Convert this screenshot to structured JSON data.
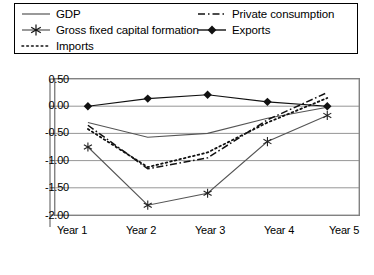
{
  "chart_data": {
    "type": "line",
    "title": "",
    "xlabel": "",
    "ylabel": "",
    "categories": [
      "Year 1",
      "Year 2",
      "Year 3",
      "Year 4",
      "Year 5"
    ],
    "ylim": [
      -2.0,
      0.5
    ],
    "yticks": [
      "0.50",
      "0.00",
      "-0.50",
      "-1.00",
      "-1.50",
      "-2.00"
    ],
    "ytick_values": [
      0.5,
      0.0,
      -0.5,
      -1.0,
      -1.5,
      -2.0
    ],
    "grid": true,
    "legend_position": "top",
    "series": [
      {
        "name": "GDP",
        "style": "solid",
        "marker": "none",
        "color": "#555555",
        "values": [
          -0.3,
          -0.57,
          -0.5,
          -0.22,
          -0.02
        ]
      },
      {
        "name": "Private consumption",
        "style": "dash-dot",
        "marker": "none",
        "color": "#111111",
        "values": [
          -0.35,
          -1.15,
          -0.95,
          -0.25,
          0.25
        ]
      },
      {
        "name": "Gross fixed capital formation",
        "style": "solid",
        "marker": "asterisk",
        "color": "#555555",
        "values": [
          -0.75,
          -1.82,
          -1.6,
          -0.65,
          -0.17
        ]
      },
      {
        "name": "Exports",
        "style": "solid",
        "marker": "diamond",
        "color": "#111111",
        "values": [
          0.0,
          0.14,
          0.21,
          0.08,
          0.0
        ]
      },
      {
        "name": "Imports",
        "style": "dotted",
        "marker": "none",
        "color": "#111111",
        "values": [
          -0.42,
          -1.12,
          -0.85,
          -0.3,
          0.15
        ]
      }
    ]
  },
  "legend": {
    "items": [
      {
        "label": "GDP"
      },
      {
        "label": "Private consumption"
      },
      {
        "label": "Gross fixed capital formation"
      },
      {
        "label": "Exports"
      },
      {
        "label": "Imports"
      }
    ]
  },
  "axis": {
    "y_labels": [
      "0.50",
      "0.00",
      "-0.50",
      "-1.00",
      "-1.50",
      "-2.00"
    ],
    "x_labels": [
      "Year 1",
      "Year 2",
      "Year 3",
      "Year 4",
      "Year 5"
    ]
  }
}
